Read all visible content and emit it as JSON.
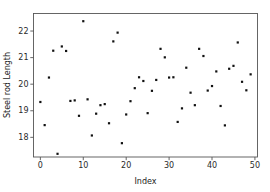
{
  "chart_data": {
    "type": "scatter",
    "title": "",
    "xlabel": "Index",
    "ylabel": "Steel rod Length",
    "xlim": [
      -1.6,
      50.6
    ],
    "ylim": [
      17.26,
      22.66
    ],
    "xticks": [
      0,
      10,
      20,
      30,
      40,
      50
    ],
    "yticks": [
      18,
      19,
      20,
      21,
      22
    ],
    "xtick_labels": [
      "0",
      "10",
      "20",
      "30",
      "40",
      "50"
    ],
    "ytick_labels": [
      "18",
      "19",
      "20",
      "21",
      "22"
    ],
    "grid": false,
    "legend": null,
    "marker": "square",
    "marker_color": "#111111",
    "marker_size": 2.2,
    "series": [
      {
        "name": "Steel rod Length",
        "x": [
          0,
          1,
          2,
          3,
          4,
          5,
          6,
          7,
          8,
          9,
          10,
          11,
          12,
          13,
          14,
          15,
          16,
          17,
          18,
          19,
          20,
          21,
          22,
          23,
          24,
          25,
          26,
          27,
          28,
          29,
          30,
          31,
          32,
          33,
          34,
          35,
          36,
          37,
          38,
          39,
          40,
          41,
          42,
          43,
          44,
          45,
          46,
          47,
          48,
          49
        ],
        "y": [
          19.33,
          18.46,
          20.25,
          21.26,
          17.38,
          21.42,
          21.25,
          19.37,
          19.39,
          18.81,
          22.37,
          19.43,
          18.07,
          18.89,
          19.21,
          19.25,
          18.53,
          21.61,
          21.94,
          17.78,
          18.86,
          19.36,
          19.85,
          20.26,
          20.12,
          18.91,
          19.75,
          20.16,
          21.33,
          21.01,
          20.25,
          20.26,
          18.58,
          19.09,
          20.62,
          19.68,
          19.21,
          21.33,
          21.06,
          19.76,
          19.93,
          20.48,
          19.18,
          18.45,
          20.58,
          20.69,
          21.57,
          20.09,
          19.77,
          20.37
        ]
      }
    ]
  },
  "axis": {
    "xlabel": "Index",
    "ylabel": "Steel rod Length"
  }
}
